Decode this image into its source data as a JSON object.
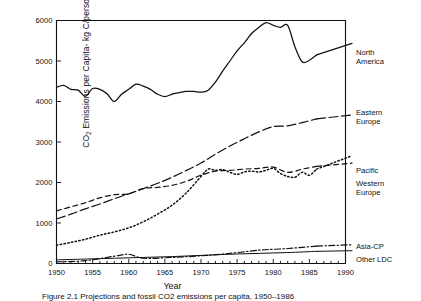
{
  "chart_data": {
    "type": "line",
    "title": "",
    "xlabel": "Year",
    "ylabel_prefix": "CO",
    "ylabel_sub": "2",
    "ylabel_rest": " Emissions per Capita- kg C/person-year",
    "xlim": [
      1950,
      1990
    ],
    "ylim": [
      0,
      6000
    ],
    "xticks": [
      1950,
      1955,
      1960,
      1965,
      1970,
      1975,
      1980,
      1985,
      1990
    ],
    "xticklabels": [
      "1950",
      "1955",
      "1960",
      "1965",
      "1970",
      "1975",
      "1980",
      "1985",
      "1990"
    ],
    "yticks": [
      0,
      1000,
      2000,
      3000,
      4000,
      5000,
      6000
    ],
    "yticklabels": [
      "0",
      "1000",
      "2000",
      "3000",
      "4000",
      "5000",
      "6000"
    ],
    "xminor_step": 1,
    "grid": false,
    "legend_position": "right-inline-labels",
    "series": [
      {
        "name": "North America",
        "label": "North\nAmerica",
        "style": "solid",
        "label_x": 356,
        "label_y": 49,
        "x": [
          1950,
          1951,
          1952,
          1953,
          1954,
          1955,
          1956,
          1957,
          1958,
          1959,
          1960,
          1961,
          1962,
          1963,
          1964,
          1965,
          1966,
          1967,
          1968,
          1969,
          1970,
          1971,
          1972,
          1973,
          1974,
          1975,
          1976,
          1977,
          1978,
          1979,
          1980,
          1981,
          1982,
          1983,
          1984,
          1985,
          1986
        ],
        "values": [
          4350,
          4400,
          4300,
          4280,
          4130,
          4320,
          4300,
          4190,
          4000,
          4180,
          4300,
          4430,
          4380,
          4300,
          4180,
          4120,
          4180,
          4220,
          4250,
          4250,
          4230,
          4280,
          4480,
          4750,
          5000,
          5250,
          5450,
          5680,
          5830,
          5950,
          5880,
          5830,
          5880,
          5350,
          4980,
          5020,
          5150
        ]
      },
      {
        "name": "Eastern Europe",
        "label": "Eastern\nEurope",
        "style": "long-dash",
        "label_x": 356,
        "label_y": 109,
        "x": [
          1950,
          1952,
          1954,
          1956,
          1958,
          1960,
          1962,
          1964,
          1966,
          1968,
          1970,
          1972,
          1974,
          1976,
          1978,
          1980,
          1982,
          1984,
          1986
        ],
        "values": [
          1100,
          1220,
          1350,
          1470,
          1600,
          1720,
          1850,
          1980,
          2130,
          2300,
          2480,
          2700,
          2900,
          3080,
          3250,
          3380,
          3400,
          3480,
          3570
        ]
      },
      {
        "name": "Pacific",
        "label": "Pacific",
        "style": "dotted",
        "label_x": 356,
        "label_y": 167,
        "x": [
          1950,
          1952,
          1954,
          1956,
          1958,
          1960,
          1962,
          1964,
          1966,
          1968,
          1970,
          1971,
          1972,
          1973,
          1974,
          1975,
          1976,
          1977,
          1978,
          1979,
          1980,
          1981,
          1982,
          1983,
          1984,
          1985,
          1986
        ],
        "values": [
          450,
          520,
          600,
          700,
          780,
          880,
          1030,
          1220,
          1440,
          1750,
          2150,
          2330,
          2300,
          2320,
          2250,
          2200,
          2260,
          2280,
          2260,
          2300,
          2350,
          2220,
          2150,
          2130,
          2250,
          2180,
          2330
        ]
      },
      {
        "name": "Western Europe",
        "label": "Western\nEurope",
        "style": "dash",
        "label_x": 356,
        "label_y": 180,
        "x": [
          1950,
          1952,
          1954,
          1956,
          1958,
          1960,
          1962,
          1964,
          1966,
          1968,
          1970,
          1972,
          1974,
          1976,
          1978,
          1980,
          1982,
          1984,
          1986
        ],
        "values": [
          1300,
          1400,
          1500,
          1620,
          1700,
          1720,
          1850,
          1880,
          1930,
          2030,
          2180,
          2280,
          2300,
          2330,
          2350,
          2380,
          2250,
          2330,
          2400
        ]
      },
      {
        "name": "Asia-CP",
        "label": "Asia-CP",
        "style": "dash-dot",
        "label_x": 356,
        "label_y": 243,
        "x": [
          1950,
          1954,
          1958,
          1960,
          1962,
          1966,
          1970,
          1974,
          1978,
          1980,
          1982,
          1984,
          1986
        ],
        "values": [
          40,
          70,
          180,
          230,
          130,
          150,
          190,
          250,
          330,
          350,
          370,
          400,
          430
        ]
      },
      {
        "name": "Other LDC",
        "label": "Other LDC",
        "style": "solid-thin",
        "label_x": 356,
        "label_y": 256,
        "x": [
          1950,
          1954,
          1958,
          1962,
          1966,
          1970,
          1974,
          1978,
          1982,
          1986
        ],
        "values": [
          90,
          110,
          130,
          150,
          170,
          200,
          230,
          250,
          270,
          300
        ]
      }
    ]
  },
  "caption": {
    "text": "Figure 2.1   Projections and fossil CO2 emissions per capita, 1950–1986"
  }
}
